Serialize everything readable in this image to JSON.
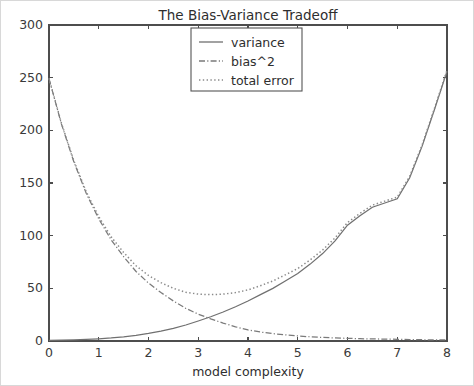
{
  "figure": {
    "title": "The Bias-Variance Tradeoff",
    "xlabel": "model complexity",
    "ylabel": ""
  },
  "legend": {
    "entries": [
      {
        "label": "variance",
        "style": "solid"
      },
      {
        "label": "bias^2",
        "style": "dashdot"
      },
      {
        "label": "total error",
        "style": "dotted"
      }
    ]
  },
  "axes": {
    "x_ticks": [
      "0",
      "1",
      "2",
      "3",
      "4",
      "5",
      "6",
      "7",
      "8"
    ],
    "y_ticks": [
      "0",
      "50",
      "100",
      "150",
      "200",
      "250",
      "300"
    ]
  },
  "chart_data": {
    "type": "line",
    "title": "The Bias-Variance Tradeoff",
    "xlabel": "model complexity",
    "ylabel": "",
    "xlim": [
      0,
      8
    ],
    "ylim": [
      0,
      300
    ],
    "grid": false,
    "legend_position": "upper center",
    "x": [
      0,
      0.25,
      0.5,
      0.75,
      1,
      1.25,
      1.5,
      1.75,
      2,
      2.25,
      2.5,
      2.75,
      3,
      3.25,
      3.5,
      3.75,
      4,
      4.25,
      4.5,
      4.75,
      5,
      5.25,
      5.5,
      5.75,
      6,
      6.25,
      6.5,
      6.75,
      7,
      7.25,
      7.5,
      7.75,
      8
    ],
    "series": [
      {
        "name": "variance",
        "style": "solid",
        "color": "#707070",
        "values": [
          0.6,
          0.8,
          1.1,
          1.5,
          2.1,
          2.9,
          4.0,
          5.4,
          7.2,
          9.4,
          12.0,
          15.2,
          19.0,
          23.0,
          27.5,
          32.5,
          38.0,
          44.0,
          50.0,
          57.0,
          64.0,
          73.0,
          83.0,
          95.0,
          110.0,
          119.0,
          127.0,
          131.0,
          135.0,
          155.0,
          185.0,
          220.0,
          256.0
        ]
      },
      {
        "name": "bias^2",
        "style": "dashdot",
        "color": "#7a7a7a",
        "values": [
          249.0,
          206.0,
          170.0,
          140.0,
          116.0,
          96.0,
          80.0,
          66.0,
          55.0,
          46.0,
          38.0,
          31.0,
          25.5,
          21.0,
          17.0,
          13.5,
          10.5,
          8.5,
          7.0,
          5.8,
          4.8,
          4.0,
          3.4,
          2.9,
          2.5,
          2.2,
          2.0,
          1.8,
          1.6,
          1.4,
          1.2,
          1.1,
          1.0
        ]
      },
      {
        "name": "total error",
        "style": "dotted",
        "color": "#8a8a8a",
        "values": [
          249.6,
          206.8,
          171.1,
          141.5,
          118.1,
          98.9,
          84.0,
          71.4,
          62.2,
          55.4,
          50.0,
          46.2,
          44.5,
          44.0,
          44.5,
          46.0,
          48.5,
          52.5,
          57.0,
          62.8,
          68.8,
          77.0,
          86.4,
          97.9,
          112.5,
          121.2,
          129.0,
          132.8,
          136.6,
          156.4,
          186.2,
          221.1,
          257.0
        ]
      }
    ]
  }
}
